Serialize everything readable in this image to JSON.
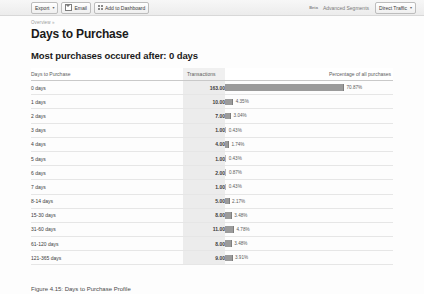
{
  "toolbar": {
    "export_label": "Export",
    "export_caret": "▾",
    "email_label": "Email",
    "add_dashboard_label": "Add to Dashboard",
    "beta_label": "Beta",
    "advanced_segments_label": "Advanced Segments",
    "segment_value": "Direct Traffic",
    "segment_caret": "▾"
  },
  "breadcrumb": {
    "label": "Overview",
    "arrow": "»"
  },
  "page_title": "Days to Purchase",
  "summary_heading": "Most purchases occured after: 0 days",
  "figure_caption": "Figure 4.15: Days to Purchase Profile",
  "colors": {
    "bar": "#9b9b9b",
    "bar_small": "#b9b9b9",
    "value_column_bg": "#ececec",
    "row_divider": "#e6e6e6",
    "header_divider": "#c9c9c9"
  },
  "table": {
    "headers": {
      "days": "Days to Purchase",
      "transactions": "Transactions",
      "percentage": "Percentage of all purchases"
    },
    "rows": [
      {
        "days": "0 days",
        "transactions": "163.00",
        "percent": "70.87%"
      },
      {
        "days": "1 days",
        "transactions": "10.00",
        "percent": "4.35%"
      },
      {
        "days": "2 days",
        "transactions": "7.00",
        "percent": "3.04%"
      },
      {
        "days": "3 days",
        "transactions": "1.00",
        "percent": "0.43%"
      },
      {
        "days": "4 days",
        "transactions": "4.00",
        "percent": "1.74%"
      },
      {
        "days": "5 days",
        "transactions": "1.00",
        "percent": "0.43%"
      },
      {
        "days": "6 days",
        "transactions": "2.00",
        "percent": "0.87%"
      },
      {
        "days": "7 days",
        "transactions": "1.00",
        "percent": "0.43%"
      },
      {
        "days": "8-14 days",
        "transactions": "5.00",
        "percent": "2.17%"
      },
      {
        "days": "15-30 days",
        "transactions": "8.00",
        "percent": "3.48%"
      },
      {
        "days": "31-60 days",
        "transactions": "11.00",
        "percent": "4.78%"
      },
      {
        "days": "61-120 days",
        "transactions": "8.00",
        "percent": "3.48%"
      },
      {
        "days": "121-365 days",
        "transactions": "9.00",
        "percent": "3.91%"
      }
    ]
  },
  "chart_data": {
    "type": "bar",
    "title": "Most purchases occured after: 0 days",
    "xlabel": "Percentage of all purchases",
    "ylabel": "Days to Purchase",
    "orientation": "horizontal",
    "grid": false,
    "legend": null,
    "categories": [
      "0 days",
      "1 days",
      "2 days",
      "3 days",
      "4 days",
      "5 days",
      "6 days",
      "7 days",
      "8-14 days",
      "15-30 days",
      "31-60 days",
      "61-120 days",
      "121-365 days"
    ],
    "series": [
      {
        "name": "Transactions",
        "values": [
          163,
          10,
          7,
          1,
          4,
          1,
          2,
          1,
          5,
          8,
          11,
          8,
          9
        ]
      },
      {
        "name": "Percentage of all purchases",
        "values": [
          70.87,
          4.35,
          3.04,
          0.43,
          1.74,
          0.43,
          0.87,
          0.43,
          2.17,
          3.48,
          4.78,
          3.48,
          3.91
        ]
      }
    ],
    "xlim": [
      0,
      70.87
    ],
    "total_transactions": 230
  }
}
